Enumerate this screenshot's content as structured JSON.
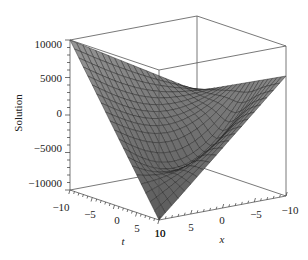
{
  "chart_data": {
    "type": "surface3d",
    "title": "",
    "xlabel": "x",
    "ylabel": "t",
    "zlabel": "Solution",
    "x_range": [
      -10,
      10
    ],
    "t_range": [
      -10,
      10
    ],
    "z_range": [
      -10000,
      10000
    ],
    "x_ticks": [
      "10",
      "5",
      "0",
      "-5",
      "-10"
    ],
    "t_ticks": [
      "-10",
      "-5",
      "0",
      "5",
      "10"
    ],
    "z_ticks": [
      "10000",
      "5000",
      "0",
      "-5000",
      "-10000"
    ],
    "z_tick_values": [
      10000,
      5000,
      0,
      -5000,
      -10000
    ],
    "x_tick_values": [
      10,
      5,
      0,
      -5,
      -10
    ],
    "t_tick_values": [
      -10,
      -5,
      0,
      5,
      10
    ],
    "surface_samples": {
      "description": "Approximate corner/edge values read from the rendered surface",
      "corners": [
        {
          "t": -10,
          "x": 10,
          "z": 10000
        },
        {
          "t": -10,
          "x": -10,
          "z": 0
        },
        {
          "t": 10,
          "x": 10,
          "z": -10000
        },
        {
          "t": 10,
          "x": -10,
          "z": 6000
        }
      ]
    },
    "grid": false,
    "box": true,
    "shading": "grayscale"
  },
  "axes": {
    "z_title": "Solution",
    "t_title": "t",
    "x_title": "x",
    "z_tick_labels": [
      "10000",
      "5000",
      "0",
      "−5000",
      "−10000"
    ],
    "t_tick_labels": [
      "−10",
      "−5",
      "0",
      "5",
      "10"
    ],
    "x_tick_labels": [
      "10",
      "5",
      "0",
      "−5",
      "−10"
    ]
  }
}
